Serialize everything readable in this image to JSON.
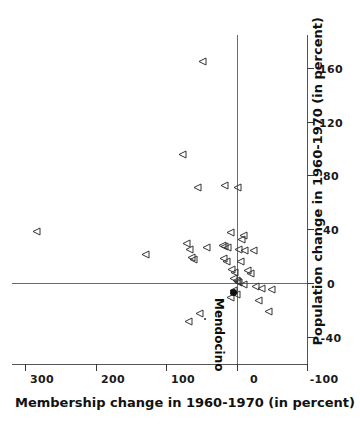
{
  "chart_data": {
    "type": "scatter",
    "title": "",
    "xlabel": "Membership change in 1960-1970 (in percent)",
    "ylabel": "Population change in 1960-1970 (in percent)",
    "xlim": [
      -100,
      320
    ],
    "ylim": [
      -60,
      185
    ],
    "xticks": [
      300,
      200,
      100,
      0,
      -100
    ],
    "yticks": [
      160,
      120,
      80,
      40,
      0,
      -40
    ],
    "xticklabels": [
      "300",
      "200",
      "100",
      "0",
      "-100"
    ],
    "yticklabels": [
      "160",
      "120",
      "80",
      "40",
      "0",
      "-40"
    ],
    "grid": false,
    "legend": null,
    "reference_lines": [
      {
        "axis": "x",
        "value": 0,
        "label": "zero membership change"
      },
      {
        "axis": "y",
        "value": 0,
        "label": "zero population change"
      }
    ],
    "marker_styles": {
      "open_triangle": "counties (open right-pointing triangle)",
      "filled_circle": "Mendocino (solid dot)"
    },
    "annotations": [
      {
        "text": "Mendocino",
        "x": 5,
        "y": -6,
        "marker": "filled_circle"
      }
    ],
    "series": [
      {
        "name": "counties",
        "marker": "open_triangle",
        "points": [
          {
            "x": 50,
            "y": 165
          },
          {
            "x": 78,
            "y": 96
          },
          {
            "x": 57,
            "y": 72
          },
          {
            "x": 18,
            "y": 73
          },
          {
            "x": 0,
            "y": 72
          },
          {
            "x": 285,
            "y": 39
          },
          {
            "x": 10,
            "y": 38
          },
          {
            "x": -8,
            "y": 36
          },
          {
            "x": -6,
            "y": 33
          },
          {
            "x": 72,
            "y": 30
          },
          {
            "x": 68,
            "y": 26
          },
          {
            "x": 44,
            "y": 27
          },
          {
            "x": 22,
            "y": 29
          },
          {
            "x": 18,
            "y": 28
          },
          {
            "x": 14,
            "y": 27
          },
          {
            "x": -2,
            "y": 26
          },
          {
            "x": -10,
            "y": 25
          },
          {
            "x": -22,
            "y": 25
          },
          {
            "x": 130,
            "y": 22
          },
          {
            "x": 66,
            "y": 20
          },
          {
            "x": 62,
            "y": 18
          },
          {
            "x": 20,
            "y": 19
          },
          {
            "x": 16,
            "y": 17
          },
          {
            "x": -4,
            "y": 17
          },
          {
            "x": 8,
            "y": 11
          },
          {
            "x": 4,
            "y": 9
          },
          {
            "x": -14,
            "y": 10
          },
          {
            "x": -18,
            "y": 8
          },
          {
            "x": 6,
            "y": 4
          },
          {
            "x": 2,
            "y": 3
          },
          {
            "x": 0,
            "y": 2
          },
          {
            "x": -2,
            "y": 1
          },
          {
            "x": -8,
            "y": 0
          },
          {
            "x": -26,
            "y": -2
          },
          {
            "x": -34,
            "y": -3
          },
          {
            "x": -48,
            "y": -4
          },
          {
            "x": 6,
            "y": -5
          },
          {
            "x": 2,
            "y": -8
          },
          {
            "x": 10,
            "y": -10
          },
          {
            "x": -30,
            "y": -12
          },
          {
            "x": 54,
            "y": -22
          },
          {
            "x": 70,
            "y": -28
          },
          {
            "x": -44,
            "y": -20
          }
        ]
      },
      {
        "name": "Mendocino",
        "marker": "filled_circle",
        "points": [
          {
            "x": 5,
            "y": -6
          }
        ]
      },
      {
        "name": "small-marker",
        "marker": "dot",
        "points": [
          {
            "x": 46,
            "y": -26
          }
        ]
      }
    ]
  },
  "axes": {
    "x_title": "Membership change in 1960-1970 (in percent)",
    "y_title": "Population change in 1960-1970 (in percent)"
  },
  "labels": {
    "mendocino": "Mendocino"
  }
}
